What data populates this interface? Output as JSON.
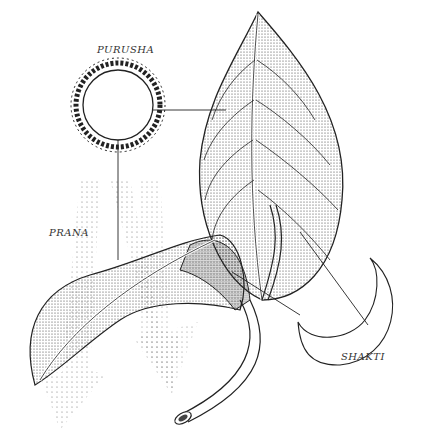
{
  "diagram": {
    "labels": {
      "purusha": "PURUSHA",
      "prana": "PRANA",
      "shakti": "SHAKTI"
    },
    "elements": [
      {
        "name": "sun",
        "label": "PURUSHA",
        "description": "radiant sun with flame-like rays"
      },
      {
        "name": "upper-leaf",
        "description": "large stippled leaf with veins"
      },
      {
        "name": "lower-leaf",
        "description": "curling stippled leaf"
      },
      {
        "name": "prana-rays",
        "label": "PRANA",
        "description": "dotted arrows descending from sun"
      },
      {
        "name": "crescent-moon",
        "label": "SHAKTI"
      },
      {
        "name": "stem",
        "description": "cut stem end"
      }
    ],
    "colors": {
      "ink": "#222222",
      "background": "#ffffff"
    }
  }
}
